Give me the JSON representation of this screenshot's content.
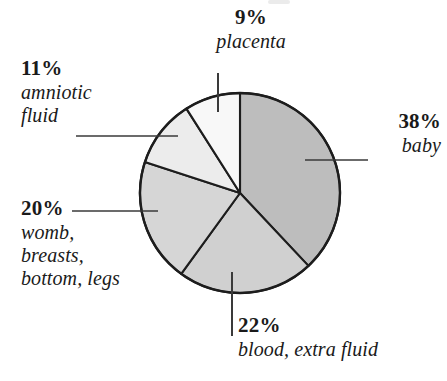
{
  "figure": {
    "background_color": "#ffffff",
    "outline_color": "#1d1d1d"
  },
  "chart_data": {
    "type": "pie",
    "title": "",
    "subtitle": "",
    "xlabel": "",
    "ylabel": "",
    "legend_position": "none",
    "grid": false,
    "units": "percent",
    "total": 100,
    "start_angle_deg": 0,
    "direction": "clockwise",
    "categories": [
      "baby",
      "blood, extra fluid",
      "womb, breasts, bottom, legs",
      "amniotic fluid",
      "placenta"
    ],
    "values": [
      38,
      22,
      20,
      11,
      9
    ],
    "labels": [
      "38%",
      "22%",
      "20%",
      "11%",
      "9%"
    ],
    "colors": [
      "#bdbdbd",
      "#d0d0d0",
      "#d6d6d6",
      "#ececec",
      "#f8f8f8"
    ],
    "slices": [
      {
        "id": "baby",
        "percent_text": "38%",
        "name": "baby",
        "value": 38,
        "color": "#bdbdbd",
        "start_angle_deg": 0,
        "end_angle_deg": 136.8,
        "leader": "horizontal-right"
      },
      {
        "id": "blood",
        "percent_text": "22%",
        "name": "blood, extra fluid",
        "value": 22,
        "color": "#d0d0d0",
        "start_angle_deg": 136.8,
        "end_angle_deg": 216,
        "leader": "vertical-down"
      },
      {
        "id": "womb",
        "percent_text": "20%",
        "name": "womb,\nbreasts,\nbottom, legs",
        "value": 20,
        "color": "#d6d6d6",
        "start_angle_deg": 216,
        "end_angle_deg": 288,
        "leader": "horizontal-left"
      },
      {
        "id": "amniotic",
        "percent_text": "11%",
        "name": "amniotic\nfluid",
        "value": 11,
        "color": "#ececec",
        "start_angle_deg": 288,
        "end_angle_deg": 327.6,
        "leader": "horizontal-left"
      },
      {
        "id": "placenta",
        "percent_text": "9%",
        "name": "placenta",
        "value": 9,
        "color": "#f8f8f8",
        "start_angle_deg": 327.6,
        "end_angle_deg": 360,
        "leader": "vertical-up"
      }
    ]
  },
  "labels": {
    "placenta": {
      "percent": "9%",
      "name": "placenta"
    },
    "amniotic": {
      "percent": "11%",
      "name_line1": "amniotic",
      "name_line2": "fluid"
    },
    "womb": {
      "percent": "20%",
      "name_line1": "womb,",
      "name_line2": "breasts,",
      "name_line3": "bottom, legs"
    },
    "baby": {
      "percent": "38%",
      "name": "baby"
    },
    "blood": {
      "percent": "22%",
      "name": "blood, extra fluid"
    }
  }
}
